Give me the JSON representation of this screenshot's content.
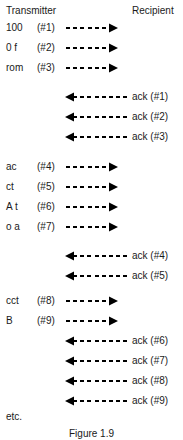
{
  "figure": {
    "caption": "Figure 1.9",
    "etc_label": "etc.",
    "headers": {
      "left": "Transmitter",
      "right": "Recipient"
    },
    "colors": {
      "background": "#ffffff",
      "ink": "#1a1a1a",
      "line": "#000000"
    }
  },
  "rows": [
    {
      "kind": "send",
      "label": "100",
      "seq": "(#1)",
      "arrow": "dashed-arrow-right",
      "top": 21
    },
    {
      "kind": "send",
      "label": "0 f",
      "seq": "(#2)",
      "arrow": "dashed-arrow-right",
      "top": 41
    },
    {
      "kind": "send",
      "label": "rom",
      "seq": "(#3)",
      "arrow": "dashed-arrow-right",
      "top": 61
    },
    {
      "kind": "ack",
      "label": "ack (#1)",
      "arrow": "dashed-arrow-left",
      "top": 90
    },
    {
      "kind": "ack",
      "label": "ack (#2)",
      "arrow": "dashed-arrow-left",
      "top": 110
    },
    {
      "kind": "ack",
      "label": "ack (#3)",
      "arrow": "dashed-arrow-left",
      "top": 130
    },
    {
      "kind": "send",
      "label": "ac",
      "seq": "(#4)",
      "arrow": "dashed-arrow-right",
      "top": 160
    },
    {
      "kind": "send",
      "label": "ct",
      "seq": "(#5)",
      "arrow": "dashed-arrow-right",
      "top": 180
    },
    {
      "kind": "send",
      "label": "A t",
      "seq": "(#6)",
      "arrow": "dashed-arrow-right",
      "top": 200
    },
    {
      "kind": "send",
      "label": "o a",
      "seq": "(#7)",
      "arrow": "dashed-arrow-right",
      "top": 220
    },
    {
      "kind": "ack",
      "label": "ack (#4)",
      "arrow": "dashed-arrow-left",
      "top": 249
    },
    {
      "kind": "ack",
      "label": "ack (#5)",
      "arrow": "dashed-arrow-left",
      "top": 269
    },
    {
      "kind": "send",
      "label": "cct",
      "seq": "(#8)",
      "arrow": "dashed-arrow-right",
      "top": 294
    },
    {
      "kind": "send",
      "label": "B",
      "seq": "(#9)",
      "arrow": "dashed-arrow-right",
      "top": 314
    },
    {
      "kind": "ack",
      "label": "ack (#6)",
      "arrow": "dashed-arrow-left",
      "top": 334
    },
    {
      "kind": "ack",
      "label": "ack (#7)",
      "arrow": "dashed-arrow-left",
      "top": 354
    },
    {
      "kind": "ack",
      "label": "ack (#8)",
      "arrow": "dashed-arrow-left",
      "top": 374
    },
    {
      "kind": "ack",
      "label": "ack (#9)",
      "arrow": "dashed-arrow-left",
      "top": 394
    }
  ],
  "etc": {
    "top": 411
  },
  "caption_pos": {
    "top": 428
  }
}
